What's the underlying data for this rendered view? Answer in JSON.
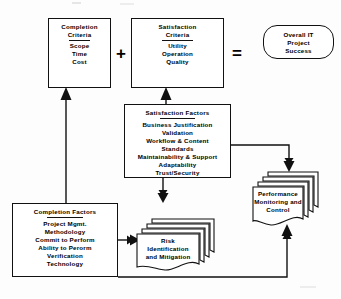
{
  "diagram": {
    "type": "flowchart",
    "stroke_color": "#111111",
    "fill_color": "#ffffff",
    "nodes": [
      {
        "id": "completion-criteria",
        "shape": "rectangle",
        "title": "Completion\nCriteria",
        "title_line1": "Completion",
        "title_line2": "Criteria",
        "items": [
          "Scope",
          "Time",
          "Cost"
        ]
      },
      {
        "id": "satisfaction-criteria",
        "shape": "rectangle",
        "title_line1": "Satisfaction",
        "title_line2": "Criteria",
        "items": [
          "Utility",
          "Operation",
          "Quality"
        ]
      },
      {
        "id": "overall-success",
        "shape": "rounded-rectangle",
        "lines": [
          "Overall  IT",
          "Project",
          "Success"
        ]
      },
      {
        "id": "satisfaction-factors",
        "shape": "rectangle",
        "title": "Satisfaction  Factors",
        "items": [
          "Business  Justification",
          "Validation",
          "Workflow  & Content",
          "Standards",
          "Maintainability  & Support",
          "Adaptability",
          "Trust/Security"
        ]
      },
      {
        "id": "completion-factors",
        "shape": "rectangle",
        "title": "Completion  Factors",
        "items": [
          "Project  Mgmt.",
          "Methodology",
          "Commit  to Perform",
          "Ability  to Perorm",
          "Verification",
          "Technology"
        ]
      },
      {
        "id": "risk",
        "shape": "stacked-document",
        "lines": [
          "Risk",
          "Identification",
          "and  Mitigation"
        ]
      },
      {
        "id": "performance",
        "shape": "stacked-document",
        "lines": [
          "Performance",
          "Monitoring   and",
          "Control"
        ]
      }
    ],
    "operators": [
      {
        "id": "plus",
        "symbol": "+"
      },
      {
        "id": "equals",
        "symbol": "="
      }
    ],
    "connectors": [
      {
        "from": "completion-factors",
        "to": "completion-criteria",
        "arrow": "up"
      },
      {
        "from": "satisfaction-factors",
        "to": "satisfaction-criteria",
        "arrow": "up"
      },
      {
        "from": "satisfaction-factors",
        "to": "risk",
        "arrow": "down"
      },
      {
        "from": "satisfaction-factors",
        "to": "performance",
        "arrow": "down"
      },
      {
        "from": "completion-factors",
        "to": "risk",
        "arrow": "right"
      },
      {
        "from": "completion-factors",
        "to": "performance",
        "arrow": "up"
      },
      {
        "from": "risk",
        "to": "performance",
        "arrow": "up"
      }
    ]
  }
}
